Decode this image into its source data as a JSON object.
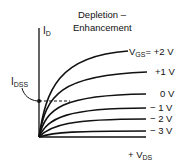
{
  "title_line1": "Depletion –",
  "title_line2": "Enhancement",
  "y_axis_label": "I",
  "y_axis_sub": "D",
  "x_axis_prefix": "+ V",
  "x_axis_sub": "DS",
  "idss_label": "I",
  "idss_sub": "DSS",
  "curves": [
    {
      "label_prefix": "V",
      "label_sub": "GS",
      "label": "= +2 V"
    },
    {
      "label": "+1 V"
    },
    {
      "label": "0 V"
    },
    {
      "label": "− 1 V"
    },
    {
      "label": "− 2 V"
    },
    {
      "label": "− 3 V"
    }
  ]
}
